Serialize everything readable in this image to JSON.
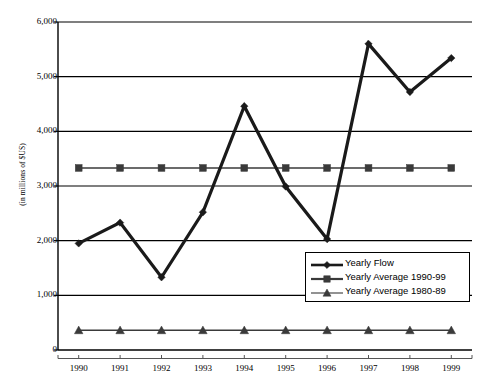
{
  "chart_data": {
    "type": "line",
    "title": "",
    "xlabel": "",
    "ylabel": "(in millions of $US)",
    "categories": [
      "1990",
      "1991",
      "1992",
      "1993",
      "1994",
      "1995",
      "1996",
      "1997",
      "1998",
      "1999"
    ],
    "x": [
      1990,
      1991,
      1992,
      1993,
      1994,
      1995,
      1996,
      1997,
      1998,
      1999
    ],
    "ylim": [
      0,
      6000
    ],
    "xlim": [
      1990,
      1999
    ],
    "y_ticks": [
      0,
      1000,
      2000,
      3000,
      4000,
      5000,
      6000
    ],
    "y_tick_labels": [
      "0",
      "1,000",
      "2,000",
      "3,000",
      "4,000",
      "5,000",
      "6,000"
    ],
    "grid": true,
    "grid_axis": "y",
    "legend_position": "lower-right",
    "series": [
      {
        "name": "Yearly Flow",
        "marker": "diamond",
        "color": "#1a1a1a",
        "values": [
          1950,
          2330,
          1330,
          2520,
          4460,
          2990,
          2030,
          5600,
          4720,
          5340
        ]
      },
      {
        "name": "Yearly Average 1990-99",
        "marker": "square",
        "color": "#3a3a3a",
        "values": [
          3330,
          3330,
          3330,
          3330,
          3330,
          3330,
          3330,
          3330,
          3330,
          3330
        ]
      },
      {
        "name": "Yearly Average 1980-89",
        "marker": "triangle",
        "color": "#3a3a3a",
        "values": [
          360,
          360,
          360,
          360,
          360,
          360,
          360,
          360,
          360,
          360
        ]
      }
    ]
  },
  "axes": {
    "y_title": "(in millions of $US)",
    "y_tick_labels": [
      "6,000",
      "5,000",
      "4,000",
      "3,000",
      "2,000",
      "1,000",
      "0"
    ],
    "x_tick_labels": [
      "1990",
      "1991",
      "1992",
      "1993",
      "1994",
      "1995",
      "1996",
      "1997",
      "1998",
      "1999"
    ]
  },
  "legend": {
    "items": [
      {
        "label": "Yearly Flow",
        "marker": "diamond"
      },
      {
        "label": "Yearly Average 1990-99",
        "marker": "square"
      },
      {
        "label": "Yearly Average 1980-89",
        "marker": "triangle"
      }
    ]
  },
  "colors": {
    "series_primary": "#1a1a1a",
    "series_secondary": "#3a3a3a",
    "grid": "#000000",
    "background": "#ffffff"
  }
}
